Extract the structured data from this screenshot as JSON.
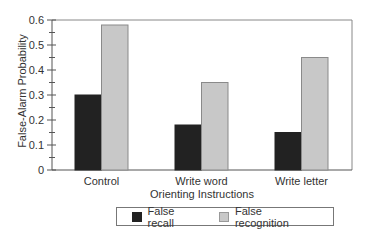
{
  "chart_data": {
    "type": "bar",
    "title": "",
    "xlabel": "Orienting Instructions",
    "ylabel": "False-Alarm Probability",
    "categories": [
      "Control",
      "Write word",
      "Write letter"
    ],
    "series": [
      {
        "name": "False recall",
        "color": "#222222",
        "values": [
          0.3,
          0.18,
          0.15
        ]
      },
      {
        "name": "False recognition",
        "color": "#c8c8c8",
        "values": [
          0.58,
          0.35,
          0.45
        ]
      }
    ],
    "ylim": [
      0,
      0.6
    ],
    "yticks": [
      "0",
      "0.1",
      "0.2",
      "0.3",
      "0.4",
      "0.5",
      "0.6"
    ],
    "grid": false,
    "legend_position": "bottom"
  },
  "axes": {
    "xlabel": "Orienting Instructions",
    "ylabel": "False-Alarm Probability"
  },
  "legend": {
    "items": [
      {
        "label": "False recall"
      },
      {
        "label": "False recognition"
      }
    ]
  }
}
